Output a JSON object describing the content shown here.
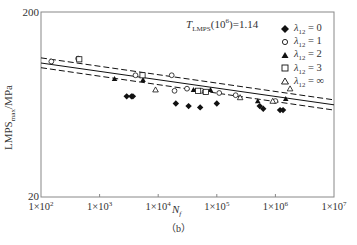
{
  "chart_data": {
    "type": "scatter",
    "title": "",
    "annotation": "T_LMPS(10^6)=1.14",
    "xlabel": "N_f",
    "ylabel": "LMPS_max/MPa",
    "caption": "(b)",
    "xscale": "log",
    "yscale": "log",
    "xlim": [
      100,
      10000000
    ],
    "ylim": [
      20,
      200
    ],
    "x_ticks": [
      "1×10^2",
      "1×10^3",
      "1×10^4",
      "1×10^5",
      "1×10^6",
      "1×10^7"
    ],
    "y_ticks": [
      "20",
      "200"
    ],
    "grid": false,
    "legend_position": "upper right",
    "series": [
      {
        "name": "λ12=0",
        "marker": "filled-diamond",
        "points": [
          [
            2900,
            70
          ],
          [
            3500,
            70
          ],
          [
            3700,
            70
          ],
          [
            20000,
            64
          ],
          [
            33000,
            62
          ],
          [
            52000,
            61
          ],
          [
            100000,
            64
          ],
          [
            540000,
            62
          ],
          [
            620000,
            60
          ],
          [
            1200000,
            59
          ],
          [
            1350000,
            59
          ]
        ]
      },
      {
        "name": "λ12=1",
        "marker": "open-circle",
        "points": [
          [
            150,
            108
          ],
          [
            430,
            112
          ],
          [
            4100,
            91
          ],
          [
            17000,
            91
          ],
          [
            19000,
            75
          ],
          [
            31000,
            77
          ],
          [
            55000,
            75
          ],
          [
            62000,
            74
          ],
          [
            110000,
            73
          ],
          [
            210000,
            71
          ],
          [
            1000000,
            66
          ]
        ]
      },
      {
        "name": "λ12=2",
        "marker": "filled-triangle",
        "points": [
          [
            1800,
            87
          ],
          [
            5500,
            86
          ],
          [
            40000,
            76
          ],
          [
            78000,
            76
          ],
          [
            500000,
            66
          ],
          [
            1500000,
            68
          ]
        ]
      },
      {
        "name": "λ12=3",
        "marker": "open-square",
        "points": [
          [
            450,
            111
          ],
          [
            5400,
            91
          ],
          [
            48000,
            75
          ],
          [
            65000,
            74
          ]
        ]
      },
      {
        "name": "λ12=∞",
        "marker": "open-triangle",
        "points": [
          [
            9000,
            76
          ],
          [
            250000,
            69
          ],
          [
            900000,
            66
          ],
          [
            1780000,
            77
          ]
        ]
      }
    ],
    "lines": [
      {
        "name": "fit",
        "style": "solid",
        "points": [
          [
            100,
            106
          ],
          [
            10000000,
            63
          ]
        ]
      },
      {
        "name": "upper-bound",
        "style": "dashed",
        "points": [
          [
            100,
            113
          ],
          [
            10000000,
            67
          ]
        ]
      },
      {
        "name": "lower-bound",
        "style": "dashed",
        "points": [
          [
            100,
            100
          ],
          [
            10000000,
            59
          ]
        ]
      }
    ]
  },
  "labels": {
    "annotation_main": "T",
    "annotation_sub": "LMPS",
    "annotation_rest": "(10",
    "annotation_sup": "6",
    "annotation_end": ")=1.14",
    "ylabel_main": "LMPS",
    "ylabel_sub": "max",
    "ylabel_end": "/MPa",
    "xlabel_main": "N",
    "xlabel_sub": "f",
    "caption": "（b）",
    "y_top": "200",
    "y_bottom": "20",
    "x_ticks": [
      {
        "base": "1×10",
        "exp": "2"
      },
      {
        "base": "1×10",
        "exp": "3"
      },
      {
        "base": "1×10",
        "exp": "4"
      },
      {
        "base": "1×10",
        "exp": "5"
      },
      {
        "base": "1×10",
        "exp": "6"
      },
      {
        "base": "1×10",
        "exp": "7"
      }
    ]
  },
  "legend": [
    {
      "marker": "filled-diamond",
      "symbol": "λ",
      "sub": "12",
      "value": "= 0"
    },
    {
      "marker": "open-circle",
      "symbol": "λ",
      "sub": "12",
      "value": "= 1"
    },
    {
      "marker": "filled-triangle",
      "symbol": "λ",
      "sub": "12",
      "value": "= 2"
    },
    {
      "marker": "open-square",
      "symbol": "λ",
      "sub": "12",
      "value": "= 3"
    },
    {
      "marker": "open-triangle",
      "symbol": "λ",
      "sub": "12",
      "value": "= ∞"
    }
  ],
  "colors": {
    "axis": "#777777",
    "marker": "#111111",
    "text": "#333333"
  }
}
